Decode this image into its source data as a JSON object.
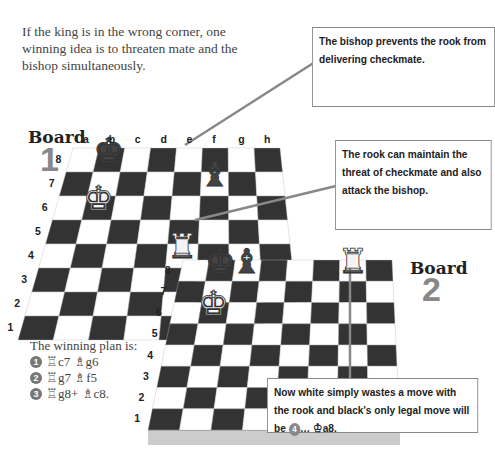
{
  "intro": "If the king is in the wrong corner, one winning idea is to threaten mate and the bishop simultaneously.",
  "callouts": {
    "bishop": "The bishop prevents the rook from delivering checkmate.",
    "rook": "The rook can maintain the threat of checkmate and also attack the bishop.",
    "waste": {
      "text_before": "Now white simply wastes a move with the rook and black's only legal move will be",
      "move_number": "4",
      "text_after": "… ♔a8."
    }
  },
  "board1": {
    "title": "Board",
    "number": "1",
    "files": [
      "a",
      "b",
      "c",
      "d",
      "e",
      "f",
      "g",
      "h"
    ],
    "ranks": [
      "8",
      "7",
      "6",
      "5",
      "4",
      "3",
      "2",
      "1"
    ],
    "pieces": [
      {
        "piece": "black-king",
        "square": "b8"
      },
      {
        "piece": "white-king",
        "square": "b6"
      },
      {
        "piece": "black-bishop",
        "square": "f7"
      },
      {
        "piece": "white-rook",
        "square": "e4"
      }
    ]
  },
  "board2": {
    "title": "Board",
    "number": "2",
    "files": [
      "a",
      "b",
      "c",
      "d",
      "e",
      "f",
      "g",
      "h"
    ],
    "ranks": [
      "8",
      "7",
      "6",
      "5",
      "4",
      "3",
      "2",
      "1"
    ],
    "pieces": [
      {
        "piece": "black-king",
        "square": "b8"
      },
      {
        "piece": "white-king",
        "square": "b6"
      },
      {
        "piece": "black-bishop",
        "square": "c8"
      },
      {
        "piece": "white-rook",
        "square": "g8"
      }
    ]
  },
  "plan": {
    "title": "The winning plan is:",
    "moves": [
      {
        "n": "1",
        "text": "♖c7 ♗g6"
      },
      {
        "n": "2",
        "text": "♖g7 ♗f5"
      },
      {
        "n": "3",
        "text": "♖g8+ ♗c8."
      }
    ]
  }
}
